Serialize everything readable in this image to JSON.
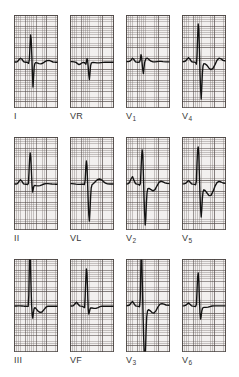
{
  "figure": {
    "kind": "12-lead-ecg",
    "rows": 3,
    "columns": 4,
    "background_color": "#ffffff",
    "grid_color": "#f2f0ef",
    "grid_line_color": "#504846",
    "trace_color": "#121212",
    "label_color": "#3a3a3a"
  },
  "chart_data": {
    "type": "line",
    "title": "",
    "subtitle": "",
    "xlabel": "",
    "ylabel": "",
    "legend_position": "none",
    "grid": true,
    "panel_layout": {
      "rows": 3,
      "cols": 4,
      "panel_width_px": 44,
      "panel_height_px": 93
    },
    "axis_notes": {
      "grid_small_box_px": 2.16,
      "grid_large_box_px": 10.8,
      "baseline_y_fraction": 0.5
    },
    "series": [
      {
        "name": "I",
        "label": "I",
        "label_sub": "",
        "row": 0,
        "col": 0,
        "baseline_y": 47,
        "points": "0,47 2,47 3.5,46.6 5,44.6 6.5,43.2 8,44.2 9.5,46.6 11,47.2 12.6,47.2 13.6,47.4 14.6,48.4 15.4,44 16.0,31 16.6,20 17.2,24 17.8,40 18.4,58 19.0,72 19.6,62 20.2,52 20.8,48.6 21.6,47.6 23,47.8 25,48.6 27,48.8 29,48.0 31,46.6 33,45.6 35,45.4 37,46.2 39,47 41,47.2 44,47.2"
      },
      {
        "name": "VR",
        "label": "VR",
        "label_sub": "",
        "row": 0,
        "col": 1,
        "baseline_y": 47,
        "points": "0,46.6 2,46.6 4,46.8 6,47.4 7.5,48.6 9,49.6 10.5,49.0 12,47.8 13.4,47.4 14.4,47.6 15.2,48.4 15.8,49.2 16.4,47 17.0,43.6 17.6,45 18.2,52 18.8,60 19.4,64.5 20.0,58 20.6,50.6 21.4,47.8 23,47.4 25,47.6 27,47.8 29,47.8 31,47.6 33,47.4 35,47.2 37,47.2 40,47.2 44,47.2"
      },
      {
        "name": "V1",
        "label": "V",
        "label_sub": "1",
        "row": 0,
        "col": 2,
        "baseline_y": 47,
        "points": "0,46.6 2,46.6 3.5,46.4 5,45.2 6.5,43.2 8,44.6 9.5,46.8 11,47.2 12.6,47.2 13.6,47.0 14.4,44.4 15.0,39.6 15.6,42 16.2,49 16.8,55 17.4,58.5 18.0,53 18.6,47.6 19.4,45.0 20.2,43.4 21.4,43.2 23,44.6 25,46.2 27,46.8 29,46.8 31,46.6 33,46.4 35,46.4 37,46.6 40,46.8 44,46.8"
      },
      {
        "name": "V4",
        "label": "V",
        "label_sub": "4",
        "row": 0,
        "col": 3,
        "baseline_y": 47,
        "points": "0,46.8 2,46.6 3.5,46.0 5,44.2 6.5,42.6 8,44.2 9.5,46.6 11,47.0 12.6,47.2 13.6,47.6 14.4,49.2 15.0,41 15.6,22 16.2,9 16.8,14 17.4,34 18.0,58 18.6,74 19.2,84 19.8,72 20.4,58 21.0,51 21.8,48.6 23,48.8 25,50.4 27,53.2 29,54.6 31,53.4 33,49.6 35,45.2 37,43.2 39,43.8 41,45.4 44,46.0"
      },
      {
        "name": "II",
        "label": "II",
        "label_sub": "",
        "row": 1,
        "col": 0,
        "baseline_y": 47,
        "points": "0,47 2,47 3.5,46.6 5,44.4 6.5,42.8 8,44.4 9.5,46.8 11,47.2 12.6,47.2 13.6,47.6 14.4,46.4 15.0,35 15.6,22 16.2,16 16.8,20 17.4,34 18.0,48 18.6,55 19.2,52.4 19.8,49.4 20.6,48.4 22,48.6 24,48.8 26,48.6 28,47.8 30,47.0 32,46.6 34,46.6 36,46.8 38,47.0 41,47.2 44,47.2"
      },
      {
        "name": "VL",
        "label": "VL",
        "label_sub": "",
        "row": 1,
        "col": 1,
        "baseline_y": 47,
        "points": "0,46.6 2,46.6 4,46.8 6,47.2 8,47.4 10,47.4 12,47.2 13.4,47.2 14.4,47.6 15.2,43 15.8,30 16.4,24 17.0,29 17.6,46 18.2,64 18.8,78 19.4,84 20.0,74 20.6,60 21.2,51 22.0,47.8 23.5,46.4 25.5,44.4 27.5,42.6 29.5,42.0 31.5,42.8 33.5,44.6 35.5,46.2 37.5,46.8 40,47.0 44,47.0"
      },
      {
        "name": "V2",
        "label": "V",
        "label_sub": "2",
        "row": 1,
        "col": 2,
        "baseline_y": 47,
        "points": "0,47 2,46.8 3.5,45.6 5,42.0 6.5,39.6 8,43.4 9.5,46.6 11,47.2 12.6,47.4 13.6,48.2 14.4,46.6 15.0,33 15.6,19 16.2,13 16.8,18 17.4,38 18.0,60 18.6,76 19.2,88 19.8,82 20.4,66 21.0,56 21.8,51.6 23,51.4 25,52.6 27,53.8 29,52.6 31,48.8 33,45.4 35,44.2 37,44.8 39,45.8 41,46.4 44,46.6"
      },
      {
        "name": "V5",
        "label": "V",
        "label_sub": "5",
        "row": 1,
        "col": 3,
        "baseline_y": 47,
        "points": "0,46.8 2,46.8 3.5,46.4 5,45.0 6.5,43.6 8,45.0 9.5,46.8 11,47.2 12.6,47.4 13.6,47.8 14.4,44 15.0,26 15.6,13 16.2,10 16.8,17 17.4,38 18.0,58 18.6,72 19.2,80 19.8,72 20.4,61 21.0,55 21.8,52.8 23,53.4 25,56.0 27,58.6 29,58.4 31,54.4 33,49.2 35,45.6 37,44.4 39,45.0 41,46.0 44,46.4"
      },
      {
        "name": "III",
        "label": "III",
        "label_sub": "",
        "row": 2,
        "col": 0,
        "baseline_y": 47,
        "points": "0,47 2,47 4,46.8 6,46.8 8,47.0 10,47.2 12,47.2 13.4,47.4 14.2,47.4 14.8,36 15.2,14 15.6,-6 16.0,-10 16.4,2 17.0,26 17.6,46 18.2,56 18.8,59 19.4,54 20.0,50 20.8,48.6 22,49.6 24,52.2 26,53.4 28,53.0 30,50.6 32,48.2 34,47.2 36,47.2 38,47.2 41,47.2 44,47.2"
      },
      {
        "name": "VF",
        "label": "VF",
        "label_sub": "",
        "row": 2,
        "col": 1,
        "baseline_y": 47,
        "points": "0,47 2,47 3.5,46.6 5,44.8 6.5,43.2 8,45.0 9.5,46.8 11,47.2 12.6,47.4 13.8,48.2 14.6,48.6 15.2,37 15.8,20 16.4,10 17.0,14 17.6,32 18.2,50 18.8,55 19.4,53 20.0,50.2 20.8,48.8 22,49.0 24,49.4 26,49.4 28,48.6 30,47.6 32,47.2 34,47.2 36,47.2 38,47.2 41,47.2 44,47.2"
      },
      {
        "name": "V3",
        "label": "V",
        "label_sub": "3",
        "row": 2,
        "col": 2,
        "baseline_y": 47,
        "points": "0,46.8 2,46.6 3.5,46.0 5,44.0 6.5,42.4 8,44.6 9.5,46.8 11,47.2 12.6,47.4 13.6,47.8 14.2,40 14.7,16 15.1,-8 15.5,-12 15.9,4 16.5,32 17.1,58 17.7,80 18.3,96 18.9,102 19.5,92 20.1,72 20.7,58 21.5,52 22.5,50.6 24,51.6 26,53.6 28,54.2 30,51.6 32,47.8 34,45.2 36,44.6 38,45.2 40,46.0 44,46.4"
      },
      {
        "name": "V6",
        "label": "V",
        "label_sub": "6",
        "row": 2,
        "col": 3,
        "baseline_y": 47,
        "points": "0,46.8 2,46.8 3.5,46.4 5,45.2 6.5,44.0 8,45.2 9.5,46.8 11,47.2 12.6,47.4 13.6,47.6 14.4,45.6 15.0,32 15.6,18 16.2,14 16.8,22 17.4,40 18.0,54 18.6,60 19.2,57 19.8,52 20.6,49.0 22,48.4 24,48.4 26,48.2 28,47.6 30,47.0 32,46.8 34,46.8 36,46.8 38,46.8 41,46.8 44,46.8"
      }
    ]
  },
  "labels": {
    "row0": [
      {
        "text": "I",
        "sub": ""
      },
      {
        "text": "VR",
        "sub": ""
      },
      {
        "text": "V",
        "sub": "1"
      },
      {
        "text": "V",
        "sub": "4"
      }
    ],
    "row1": [
      {
        "text": "II",
        "sub": ""
      },
      {
        "text": "VL",
        "sub": ""
      },
      {
        "text": "V",
        "sub": "2"
      },
      {
        "text": "V",
        "sub": "5"
      }
    ],
    "row2": [
      {
        "text": "III",
        "sub": ""
      },
      {
        "text": "VF",
        "sub": ""
      },
      {
        "text": "V",
        "sub": "3"
      },
      {
        "text": "V",
        "sub": "6"
      }
    ]
  }
}
